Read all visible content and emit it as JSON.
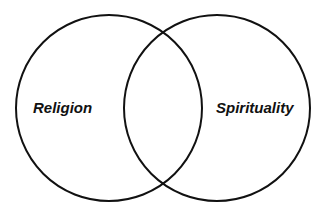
{
  "diagram": {
    "type": "venn",
    "sets": [
      {
        "label": "Religion",
        "cx": 109,
        "cy": 108,
        "r": 93
      },
      {
        "label": "Spirituality",
        "cx": 217,
        "cy": 108,
        "r": 93
      }
    ],
    "stroke_color": "#111111",
    "background_color": "#ffffff"
  }
}
